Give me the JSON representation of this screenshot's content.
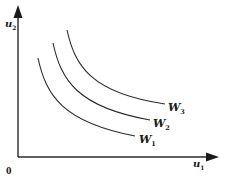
{
  "figure": {
    "type": "indifference-curves",
    "axes": {
      "x_label": "u",
      "x_label_sub": "1",
      "y_label": "u",
      "y_label_sub": "2",
      "origin_label": "0"
    },
    "curves": [
      {
        "label": "W",
        "sub": "1",
        "description": "lowest welfare curve"
      },
      {
        "label": "W",
        "sub": "2",
        "description": "middle welfare curve"
      },
      {
        "label": "W",
        "sub": "3",
        "description": "highest welfare curve"
      }
    ],
    "colors": {
      "stroke": "#2a2a2a",
      "background": "#ffffff"
    }
  }
}
